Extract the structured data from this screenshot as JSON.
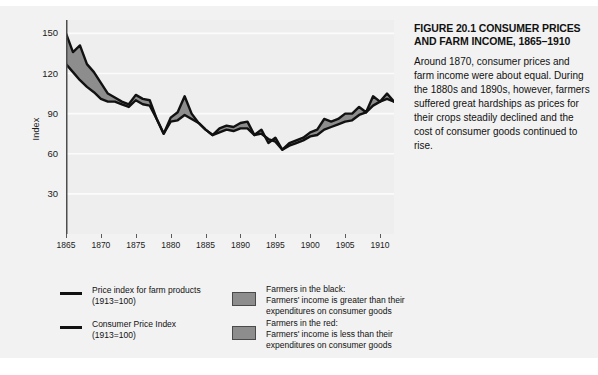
{
  "caption": {
    "title": "FIGURE 20.1  CONSUMER PRICES AND FARM INCOME, 1865–1910",
    "body": "Around 1870, consumer prices and farm income were about equal. During the 1880s and 1890s, however, farmers suffered great hardships as prices for their crops steadily declined and the cost of consumer goods continued to rise."
  },
  "legend": {
    "lines": [
      {
        "label_line1": "Price index for farm products",
        "label_line2": "(1913=100)",
        "color": "#111111"
      },
      {
        "label_line1": "Consumer Price Index",
        "label_line2": "(1913=100)",
        "color": "#111111"
      }
    ],
    "bands": [
      {
        "title": "Farmers in the black:",
        "desc_line1": "Farmers' income is greater than their",
        "desc_line2": "expenditures on consumer goods",
        "color": "#8d8d8d"
      },
      {
        "title": "Farmers in the red:",
        "desc_line1": "Farmers' income is less than their",
        "desc_line2": "expenditures on consumer goods",
        "color": "#8d8d8d"
      }
    ]
  },
  "chart_data": {
    "type": "line",
    "xlabel": "",
    "ylabel": "Index",
    "xlim": [
      1865,
      1912
    ],
    "ylim": [
      0,
      160
    ],
    "y_ticks": [
      30,
      60,
      90,
      120,
      150
    ],
    "x_ticks": [
      1865,
      1870,
      1875,
      1880,
      1885,
      1890,
      1895,
      1900,
      1905,
      1910
    ],
    "grid": true,
    "legend_position": "below",
    "x": [
      1865,
      1866,
      1867,
      1868,
      1869,
      1870,
      1871,
      1872,
      1873,
      1874,
      1875,
      1876,
      1877,
      1878,
      1879,
      1880,
      1881,
      1882,
      1883,
      1884,
      1885,
      1886,
      1887,
      1888,
      1889,
      1890,
      1891,
      1892,
      1893,
      1894,
      1895,
      1896,
      1897,
      1898,
      1899,
      1900,
      1901,
      1902,
      1903,
      1904,
      1905,
      1906,
      1907,
      1908,
      1909,
      1910,
      1911,
      1912
    ],
    "series": [
      {
        "name": "Price index for farm products (1913=100)",
        "color": "#111111",
        "values": [
          150,
          136,
          141,
          127,
          121,
          113,
          105,
          102,
          99,
          97,
          104,
          101,
          100,
          86,
          75,
          87,
          91,
          103,
          90,
          83,
          78,
          74,
          79,
          81,
          80,
          83,
          84,
          74,
          78,
          68,
          72,
          63,
          68,
          70,
          72,
          76,
          78,
          86,
          84,
          86,
          90,
          90,
          95,
          91,
          103,
          99,
          105,
          99
        ]
      },
      {
        "name": "Consumer Price Index (1913=100)",
        "color": "#111111",
        "values": [
          127,
          121,
          115,
          110,
          106,
          101,
          99,
          99,
          97,
          95,
          100,
          97,
          96,
          86,
          75,
          84,
          85,
          89,
          86,
          83,
          78,
          74,
          76,
          78,
          77,
          79,
          79,
          74,
          75,
          71,
          69,
          63,
          66,
          68,
          70,
          73,
          74,
          78,
          80,
          82,
          84,
          85,
          89,
          91,
          96,
          99,
          101,
          99
        ]
      }
    ],
    "band_label_black": "Farmers in the black",
    "band_label_red": "Farmers in the red",
    "band_color": "#8d8d8d"
  },
  "axis": {
    "y_title": "Index"
  }
}
